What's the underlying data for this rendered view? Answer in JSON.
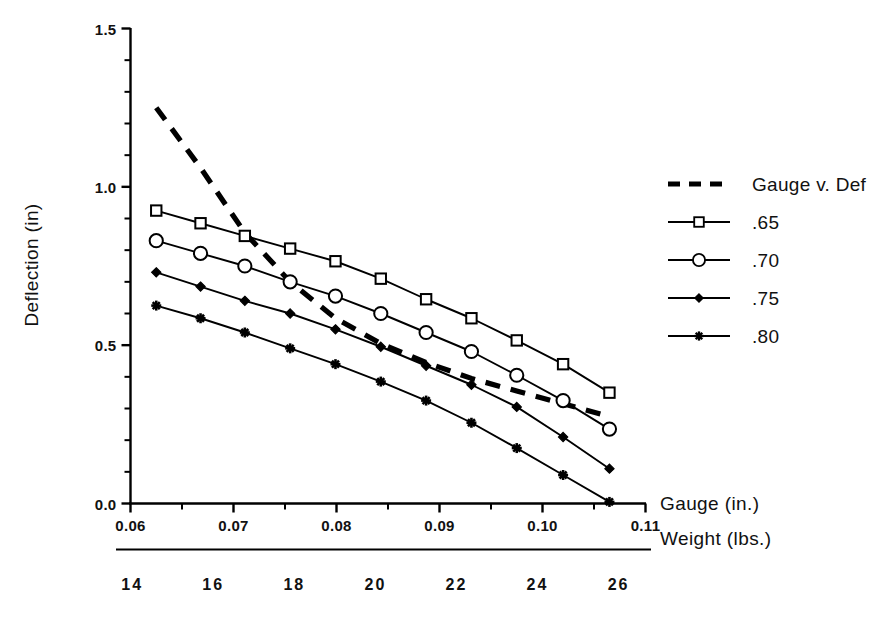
{
  "chart_data": {
    "type": "line",
    "title": "",
    "xlabel": "Gauge (in.)",
    "ylabel": "Deflection (in)",
    "secondary_xlabel": "Weight (lbs.)",
    "xlim": [
      0.06,
      0.11
    ],
    "ylim": [
      0.0,
      1.5
    ],
    "xticks": [
      0.06,
      0.07,
      0.08,
      0.09,
      0.1,
      0.11
    ],
    "xtick_labels": [
      "0.06",
      "0.07",
      "0.08",
      "0.09",
      "0.10",
      "0.11"
    ],
    "yticks": [
      0.0,
      0.5,
      1.0,
      1.5
    ],
    "ytick_labels": [
      "0.0",
      "0.5",
      "1.0",
      "1.5"
    ],
    "y_minor_tick_step": 0.1,
    "x_minor_tick_step": 0.005,
    "weight_axis": {
      "label": "Weight (lbs.)",
      "ticks": [
        14,
        16,
        18,
        20,
        22,
        24,
        26
      ],
      "tick_labels": [
        "14",
        "16",
        "18",
        "20",
        "22",
        "24",
        "26"
      ],
      "range": [
        13.6,
        26.8
      ]
    },
    "grid": false,
    "legend_position": "right",
    "x": [
      0.0625,
      0.0668,
      0.0711,
      0.0755,
      0.0799,
      0.0843,
      0.0887,
      0.0931,
      0.0975,
      0.102,
      0.1065
    ],
    "series": [
      {
        "name": "Gauge v. Def",
        "marker": "none",
        "linestyle": "dashed",
        "x": [
          0.0625,
          0.0668,
          0.0711,
          0.0755,
          0.0799,
          0.0843,
          0.0887,
          0.0931,
          0.0975,
          0.102,
          0.1065
        ],
        "values": [
          1.25,
          1.06,
          0.855,
          0.7,
          0.585,
          0.505,
          0.445,
          0.395,
          0.355,
          0.315,
          0.275
        ]
      },
      {
        "name": ".65",
        "marker": "open-square",
        "linestyle": "solid",
        "x": [
          0.0625,
          0.0668,
          0.0711,
          0.0755,
          0.0799,
          0.0843,
          0.0887,
          0.0931,
          0.0975,
          0.102,
          0.1065
        ],
        "values": [
          0.925,
          0.885,
          0.845,
          0.805,
          0.765,
          0.71,
          0.645,
          0.585,
          0.515,
          0.44,
          0.35
        ]
      },
      {
        "name": ".70",
        "marker": "open-circle",
        "linestyle": "solid",
        "x": [
          0.0625,
          0.0668,
          0.0711,
          0.0755,
          0.0799,
          0.0843,
          0.0887,
          0.0931,
          0.0975,
          0.102,
          0.1065
        ],
        "values": [
          0.83,
          0.79,
          0.75,
          0.7,
          0.655,
          0.6,
          0.54,
          0.48,
          0.405,
          0.325,
          0.235
        ]
      },
      {
        "name": ".75",
        "marker": "filled-diamond",
        "linestyle": "solid",
        "x": [
          0.0625,
          0.0668,
          0.0711,
          0.0755,
          0.0799,
          0.0843,
          0.0887,
          0.0931,
          0.0975,
          0.102,
          0.1065
        ],
        "values": [
          0.73,
          0.685,
          0.64,
          0.6,
          0.55,
          0.495,
          0.435,
          0.375,
          0.305,
          0.21,
          0.11
        ]
      },
      {
        "name": ".80",
        "marker": "star",
        "linestyle": "solid",
        "x": [
          0.0625,
          0.0668,
          0.0711,
          0.0755,
          0.0799,
          0.0843,
          0.0887,
          0.0931,
          0.0975,
          0.102,
          0.1065
        ],
        "values": [
          0.625,
          0.585,
          0.54,
          0.49,
          0.44,
          0.385,
          0.325,
          0.255,
          0.175,
          0.09,
          0.005
        ]
      }
    ]
  },
  "legend": {
    "entries": [
      {
        "label": "Gauge v. Def",
        "marker": "none",
        "linestyle": "dashed"
      },
      {
        "label": ".65",
        "marker": "open-square",
        "linestyle": "solid"
      },
      {
        "label": ".70",
        "marker": "open-circle",
        "linestyle": "solid"
      },
      {
        "label": ".75",
        "marker": "filled-diamond",
        "linestyle": "solid"
      },
      {
        "label": ".80",
        "marker": "star",
        "linestyle": "solid"
      }
    ]
  },
  "colors": {
    "line": "#000000",
    "text": "#111111",
    "background": "#ffffff"
  }
}
